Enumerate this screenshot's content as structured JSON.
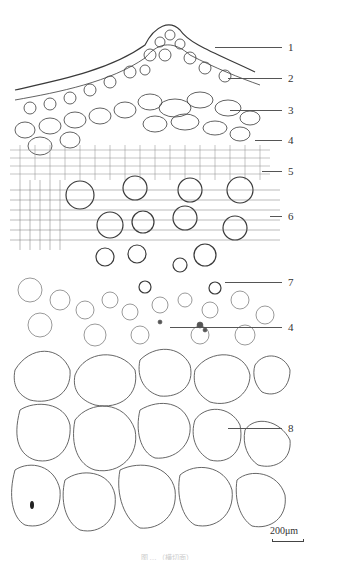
{
  "figure": {
    "type": "plant stem transverse section micrograph",
    "labels": [
      {
        "text": "1",
        "y": 47,
        "line_start_x": 215
      },
      {
        "text": "2",
        "y": 78,
        "line_start_x": 228
      },
      {
        "text": "3",
        "y": 110,
        "line_start_x": 230
      },
      {
        "text": "4",
        "y": 140,
        "line_start_x": 255
      },
      {
        "text": "5",
        "y": 171,
        "line_start_x": 262
      },
      {
        "text": "6",
        "y": 216,
        "line_start_x": 270
      },
      {
        "text": "7",
        "y": 282,
        "line_start_x": 225
      },
      {
        "text": "4",
        "y": 327,
        "line_start_x": 170
      },
      {
        "text": "8",
        "y": 428,
        "line_start_x": 228
      }
    ],
    "scale_bar": {
      "label": "200μm"
    },
    "caption": "图 … （横切面）"
  },
  "colors": {
    "background": "#ffffff",
    "cell_wall": "#3a3a3a",
    "leader_line": "#555555"
  }
}
